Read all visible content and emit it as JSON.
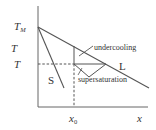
{
  "diagram": {
    "type": "phase-diagram",
    "axes": {
      "y_label": "T",
      "x_label": "x"
    },
    "labels": {
      "melting_point": "T",
      "melting_point_sub": "M",
      "temperature": "T",
      "composition": "x",
      "composition_sub": "0",
      "solidus": "S",
      "liquidus": "L",
      "undercooling": "undercooling",
      "supersaturation": "supersaturation"
    },
    "colors": {
      "line": "#555555",
      "text": "#333333"
    }
  }
}
